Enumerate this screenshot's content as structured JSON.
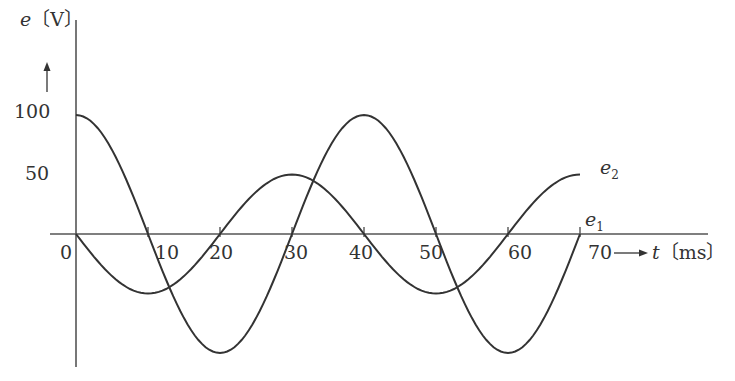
{
  "chart_data": {
    "type": "line",
    "title": "",
    "xlabel": "t [ms]",
    "ylabel": "e [V]",
    "x_axis": {
      "var": "t",
      "unit": "[ms]",
      "ticks": [
        0,
        10,
        20,
        30,
        40,
        50,
        60,
        70
      ],
      "tick_labels": [
        "0",
        "10",
        "20",
        "30",
        "40",
        "50",
        "60",
        "70"
      ],
      "range": [
        0,
        70
      ]
    },
    "y_axis": {
      "var": "e",
      "unit": "[V]",
      "tick_labels": [
        "100",
        "50"
      ],
      "ticks": [
        100,
        50
      ],
      "range": [
        -100,
        100
      ]
    },
    "grid": false,
    "legend": "inline labels at curve ends",
    "series": [
      {
        "name": "e1",
        "description": "100·cos(2πt/40)",
        "amplitude": 100,
        "period_ms": 40,
        "x": [
          0,
          5,
          10,
          15,
          20,
          25,
          30,
          35,
          40,
          45,
          50,
          55,
          60,
          65,
          70
        ],
        "values": [
          100,
          70.7,
          0,
          -70.7,
          -100,
          -70.7,
          0,
          70.7,
          100,
          70.7,
          0,
          -70.7,
          -100,
          -70.7,
          0
        ]
      },
      {
        "name": "e2",
        "description": "-50·sin(2πt/40)",
        "amplitude": 50,
        "period_ms": 40,
        "x": [
          0,
          5,
          10,
          15,
          20,
          25,
          30,
          35,
          40,
          45,
          50,
          55,
          60,
          65,
          70
        ],
        "values": [
          0,
          -35.4,
          -50,
          -35.4,
          0,
          35.4,
          50,
          35.4,
          0,
          -35.4,
          -50,
          -35.4,
          0,
          35.4,
          50
        ]
      }
    ]
  },
  "labels": {
    "y_var": "e",
    "y_unit": "〔V〕",
    "x_var": "t",
    "x_unit": "〔ms〕",
    "arrow_right": "→",
    "arrow_up": "↑",
    "origin": "0",
    "y100": "100",
    "y50": "50",
    "x10": "10",
    "x20": "20",
    "x30": "30",
    "x40": "40",
    "x50": "50",
    "x60": "60",
    "x70": "70",
    "e1_base": "e",
    "e1_sub": "1",
    "e2_base": "e",
    "e2_sub": "2"
  },
  "colors": {
    "line": "#333333",
    "axis": "#555555",
    "background": "#ffffff"
  }
}
